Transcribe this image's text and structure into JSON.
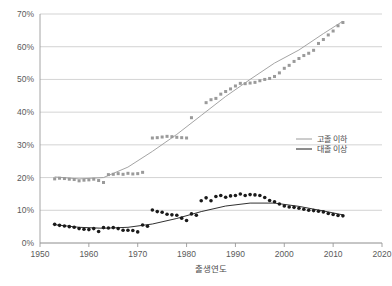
{
  "chart_data": {
    "type": "scatter",
    "title": "",
    "xlabel": "출생연도",
    "ylabel": "",
    "xlim": [
      1950,
      2020
    ],
    "ylim": [
      0,
      0.7
    ],
    "grid": true,
    "legend_position": "right-middle",
    "xticks": [
      "1950",
      "1960",
      "1970",
      "1980",
      "1990",
      "2000",
      "2010",
      "2020"
    ],
    "xtick_values": [
      1950,
      1960,
      1970,
      1980,
      1990,
      2000,
      2010,
      2020
    ],
    "yticks": [
      "0%",
      "10%",
      "20%",
      "30%",
      "40%",
      "50%",
      "60%",
      "70%"
    ],
    "ytick_values": [
      0,
      10,
      20,
      30,
      40,
      50,
      60,
      70
    ],
    "colors": {
      "series_highschool": "#9a9a9a",
      "series_college": "#1a1a1a",
      "grid": "#c8c8c8",
      "axis": "#9a9a9a",
      "text": "#5a5a5a"
    },
    "series": [
      {
        "name": "고졸 이하",
        "color": "#9a9a9a",
        "marker": "square",
        "x": [
          1953,
          1954,
          1955,
          1956,
          1957,
          1958,
          1959,
          1960,
          1961,
          1962,
          1963,
          1964,
          1965,
          1966,
          1967,
          1968,
          1969,
          1970,
          1971,
          1973,
          1974,
          1975,
          1976,
          1977,
          1978,
          1979,
          1980,
          1981,
          1984,
          1985,
          1986,
          1987,
          1988,
          1989,
          1990,
          1991,
          1992,
          1993,
          1994,
          1995,
          1996,
          1997,
          1998,
          1999,
          2000,
          2001,
          2002,
          2003,
          2004,
          2005,
          2006,
          2007,
          2008,
          2009,
          2010,
          2011,
          2012
        ],
        "values": [
          19.6,
          19.8,
          19.7,
          19.5,
          19.4,
          19.0,
          19.2,
          19.3,
          19.5,
          19.1,
          18.5,
          20.9,
          21.0,
          21.2,
          21.0,
          21.3,
          21.1,
          21.2,
          21.6,
          32.1,
          32.2,
          32.4,
          32.6,
          32.5,
          32.3,
          32.2,
          32.1,
          38.3,
          42.9,
          43.8,
          44.2,
          45.5,
          46.3,
          47.1,
          48.0,
          48.8,
          48.7,
          48.9,
          49.1,
          49.6,
          50.0,
          50.3,
          50.9,
          52.0,
          53.4,
          54.3,
          55.5,
          56.4,
          57.3,
          58.0,
          58.9,
          61.0,
          62.2,
          63.6,
          64.8,
          66.4,
          67.4
        ]
      },
      {
        "name": "대졸 이상",
        "color": "#1a1a1a",
        "marker": "circle",
        "x": [
          1953,
          1954,
          1955,
          1956,
          1957,
          1958,
          1959,
          1960,
          1961,
          1962,
          1963,
          1964,
          1965,
          1966,
          1967,
          1968,
          1969,
          1970,
          1971,
          1972,
          1973,
          1974,
          1975,
          1976,
          1977,
          1978,
          1979,
          1980,
          1981,
          1982,
          1983,
          1984,
          1985,
          1986,
          1987,
          1988,
          1989,
          1990,
          1991,
          1992,
          1993,
          1994,
          1995,
          1996,
          1997,
          1998,
          1999,
          2000,
          2001,
          2002,
          2003,
          2004,
          2005,
          2006,
          2007,
          2008,
          2009,
          2010,
          2011,
          2012
        ],
        "values": [
          5.7,
          5.4,
          5.2,
          5.0,
          4.8,
          4.4,
          4.2,
          4.1,
          4.4,
          3.5,
          4.7,
          4.6,
          4.7,
          4.4,
          3.9,
          3.9,
          3.8,
          3.4,
          5.5,
          5.1,
          10.1,
          9.6,
          9.4,
          8.8,
          8.6,
          8.5,
          7.6,
          6.9,
          8.9,
          8.5,
          12.9,
          13.8,
          12.9,
          14.2,
          14.5,
          14.0,
          14.4,
          14.5,
          15.0,
          14.5,
          14.8,
          14.7,
          14.5,
          13.9,
          13.0,
          12.6,
          11.9,
          11.3,
          11.0,
          10.9,
          10.6,
          10.3,
          10.0,
          9.9,
          9.7,
          9.5,
          9.0,
          8.7,
          8.4,
          8.3
        ]
      }
    ],
    "trend_lines": [
      {
        "name": "고졸 이하 trend",
        "color": "#9a9a9a",
        "x": [
          1953,
          1958,
          1963,
          1968,
          1973,
          1978,
          1983,
          1988,
          1993,
          1998,
          2003,
          2008,
          2012
        ],
        "values": [
          20.2,
          19.6,
          20.0,
          23.2,
          28.0,
          33.2,
          39.0,
          44.8,
          50.0,
          55.0,
          59.0,
          64.0,
          67.8
        ]
      },
      {
        "name": "대졸 이상 trend",
        "color": "#1a1a1a",
        "x": [
          1953,
          1958,
          1963,
          1968,
          1973,
          1978,
          1983,
          1988,
          1993,
          1998,
          2003,
          2008,
          2012
        ],
        "values": [
          5.6,
          4.8,
          4.5,
          4.8,
          5.8,
          7.5,
          9.6,
          11.3,
          12.2,
          12.2,
          11.2,
          9.8,
          8.6
        ]
      }
    ]
  }
}
